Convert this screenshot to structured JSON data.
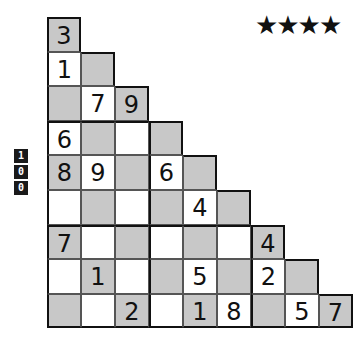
{
  "difficulty": {
    "stars_text": "★★★★",
    "count": 4
  },
  "page_number": {
    "digits": [
      "1",
      "0",
      "0"
    ]
  },
  "puzzle": {
    "shape": "staircase",
    "rows": 9,
    "shading": {
      "grey": "#c8c8c8",
      "white": "#ffffff"
    },
    "grid": [
      [
        "3"
      ],
      [
        "1",
        ""
      ],
      [
        "",
        "7",
        "9"
      ],
      [
        "6",
        "",
        "",
        ""
      ],
      [
        "8",
        "9",
        "",
        "6",
        ""
      ],
      [
        "",
        "",
        "",
        "",
        "4",
        ""
      ],
      [
        "7",
        "",
        "",
        "",
        "",
        "",
        "4"
      ],
      [
        "",
        "1",
        "",
        "",
        "5",
        "",
        "2",
        ""
      ],
      [
        "",
        "",
        "2",
        "",
        "1",
        "8",
        "",
        "5",
        "7"
      ]
    ]
  }
}
